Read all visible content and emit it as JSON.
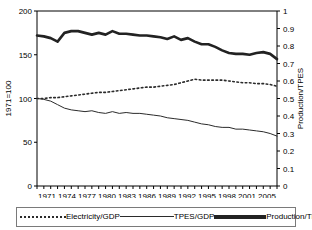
{
  "chart_data": {
    "type": "line",
    "title": "",
    "xlabel": "",
    "ylabel": "1971=100",
    "y2label": "Production/TPES",
    "xlim": [
      1971,
      2006
    ],
    "ylim": [
      0,
      200
    ],
    "y2lim": [
      0,
      1
    ],
    "grid": false,
    "legend_position": "bottom",
    "x": [
      1971,
      1972,
      1973,
      1974,
      1975,
      1976,
      1977,
      1978,
      1979,
      1980,
      1981,
      1982,
      1983,
      1984,
      1985,
      1986,
      1987,
      1988,
      1989,
      1990,
      1991,
      1992,
      1993,
      1994,
      1995,
      1996,
      1997,
      1998,
      1999,
      2000,
      2001,
      2002,
      2003,
      2004,
      2005,
      2006
    ],
    "xticklabels": [
      "1971",
      "1974",
      "1977",
      "1980",
      "1983",
      "1986",
      "1989",
      "1992",
      "1995",
      "1998",
      "2001",
      "2005"
    ],
    "yticklabels": [
      "0",
      "50",
      "100",
      "150",
      "200"
    ],
    "ytickvalues": [
      0,
      50,
      100,
      150,
      200
    ],
    "y2ticklabels": [
      "0",
      "0.1",
      "0.2",
      "0.3",
      "0.4",
      "0.5",
      "0.6",
      "0.7",
      "0.8",
      "0.9",
      "1"
    ],
    "y2tickvalues": [
      0,
      0.1,
      0.2,
      0.3,
      0.4,
      0.5,
      0.6,
      0.7,
      0.8,
      0.9,
      1
    ],
    "series": [
      {
        "name": "Electricity/GDP",
        "axis": "left",
        "style": "dotted",
        "color": "#2b2b2b",
        "values": [
          100,
          100,
          101,
          101,
          102,
          103,
          104,
          105,
          106,
          107,
          107,
          108,
          109,
          110,
          111,
          112,
          113,
          113,
          114,
          115,
          116,
          118,
          120,
          122,
          121,
          121,
          121,
          121,
          120,
          119,
          118,
          118,
          117,
          117,
          116,
          114
        ]
      },
      {
        "name": "TPES/GDP",
        "axis": "left",
        "style": "solid-thin",
        "color": "#2b2b2b",
        "values": [
          100,
          99,
          97,
          93,
          89,
          87,
          86,
          85,
          86,
          84,
          83,
          85,
          83,
          84,
          83,
          83,
          82,
          81,
          80,
          78,
          77,
          76,
          75,
          73,
          71,
          70,
          68,
          67,
          67,
          65,
          65,
          64,
          63,
          62,
          60,
          57
        ]
      },
      {
        "name": "Production/TPES",
        "axis": "right",
        "style": "solid-thick",
        "color": "#222222",
        "values": [
          0.86,
          0.855,
          0.845,
          0.825,
          0.875,
          0.885,
          0.885,
          0.875,
          0.865,
          0.875,
          0.865,
          0.885,
          0.87,
          0.87,
          0.865,
          0.86,
          0.86,
          0.855,
          0.85,
          0.84,
          0.855,
          0.835,
          0.845,
          0.825,
          0.81,
          0.81,
          0.795,
          0.775,
          0.76,
          0.755,
          0.755,
          0.75,
          0.76,
          0.765,
          0.755,
          0.725
        ]
      }
    ],
    "legend": [
      "Electricity/GDP",
      "TPES/GDP",
      "Production/TPES"
    ],
    "axis_color": "#000000"
  }
}
